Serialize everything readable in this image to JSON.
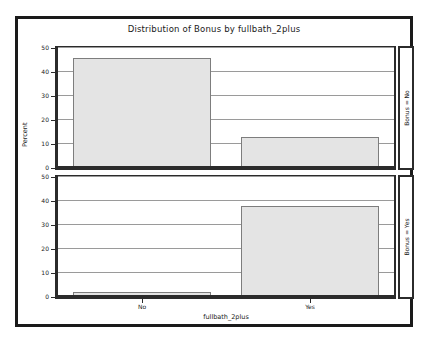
{
  "chart_data": {
    "type": "bar",
    "title": "Distribution of Bonus by fullbath_2plus",
    "xlabel": "fullbath_2plus",
    "ylabel": "Percent",
    "categories": [
      "No",
      "Yes"
    ],
    "ylim": [
      0,
      50
    ],
    "yticks": [
      0,
      10,
      20,
      30,
      40,
      50
    ],
    "ytick_labels": [
      "0",
      "10",
      "20",
      "30",
      "40",
      "50"
    ],
    "grid": true,
    "legend": "none",
    "layout": "vertical panels, 2 rows, 1 column",
    "panels": [
      {
        "strip_label": "Bonus = No",
        "categories": [
          "No",
          "Yes"
        ],
        "values": [
          46,
          13
        ]
      },
      {
        "strip_label": "Bonus = Yes",
        "categories": [
          "No",
          "Yes"
        ],
        "values": [
          2,
          38
        ]
      }
    ],
    "colors": {
      "bar_fill": "#e4e4e4",
      "bar_edge": "#7d7d7d",
      "gridline": "#9a9a9a",
      "axis": "#2b2b2b",
      "frame": "#1a1a1a",
      "text": "#1a1a1a",
      "background": "#ffffff"
    }
  }
}
